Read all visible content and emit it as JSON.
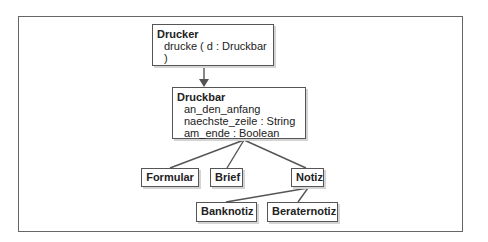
{
  "diagram": {
    "type": "class-diagram",
    "colors": {
      "line": "#555555",
      "frame": "#666666",
      "background": "#ffffff",
      "text": "#222222"
    },
    "classes": {
      "drucker": {
        "name": "Drucker",
        "members": [
          "drucke ( d : Druckbar )"
        ]
      },
      "druckbar": {
        "name": "Druckbar",
        "members": [
          "an_den_anfang",
          "naechste_zeile : String",
          "am_ende : Boolean"
        ]
      },
      "formular": {
        "name": "Formular"
      },
      "brief": {
        "name": "Brief"
      },
      "notiz": {
        "name": "Notiz"
      },
      "banknotiz": {
        "name": "Banknotiz"
      },
      "beraternotiz": {
        "name": "Beraternotiz"
      }
    },
    "relations": [
      {
        "from": "Drucker",
        "to": "Druckbar",
        "kind": "uses (arrow)"
      },
      {
        "from": "Formular",
        "to": "Druckbar",
        "kind": "inheritance"
      },
      {
        "from": "Brief",
        "to": "Druckbar",
        "kind": "inheritance"
      },
      {
        "from": "Notiz",
        "to": "Druckbar",
        "kind": "inheritance"
      },
      {
        "from": "Banknotiz",
        "to": "Notiz",
        "kind": "inheritance"
      },
      {
        "from": "Beraternotiz",
        "to": "Notiz",
        "kind": "inheritance"
      }
    ]
  }
}
